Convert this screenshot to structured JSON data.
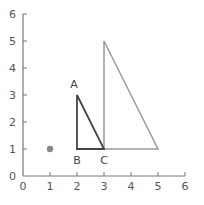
{
  "chart_data": {
    "type": "scatter",
    "title": "",
    "xlabel": "",
    "ylabel": "",
    "xlim": [
      0,
      6
    ],
    "ylim": [
      0,
      6
    ],
    "x_ticks": [
      "0",
      "1",
      "2",
      "3",
      "4",
      "5",
      "6"
    ],
    "y_ticks": [
      "0",
      "1",
      "2",
      "3",
      "4",
      "5",
      "6"
    ],
    "grid": false,
    "points": [
      {
        "name": "center-point",
        "x": 1,
        "y": 1,
        "color": "#888888"
      }
    ],
    "shapes": [
      {
        "name": "small-triangle",
        "vertices": [
          {
            "label": "A",
            "x": 2,
            "y": 3
          },
          {
            "label": "B",
            "x": 2,
            "y": 1
          },
          {
            "label": "C",
            "x": 3,
            "y": 1
          }
        ],
        "color": "#444444"
      },
      {
        "name": "large-triangle",
        "vertices": [
          {
            "label": "",
            "x": 3,
            "y": 5
          },
          {
            "label": "",
            "x": 3,
            "y": 1
          },
          {
            "label": "",
            "x": 5,
            "y": 1
          }
        ],
        "color": "#999999"
      }
    ],
    "vertex_labels": [
      {
        "text": "A",
        "x": 2,
        "y": 3,
        "pos": "above"
      },
      {
        "text": "B",
        "x": 2,
        "y": 1,
        "pos": "below"
      },
      {
        "text": "C",
        "x": 3,
        "y": 1,
        "pos": "below"
      }
    ],
    "axis_color": "#777777"
  }
}
